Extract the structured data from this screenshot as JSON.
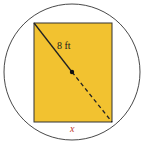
{
  "diagram": {
    "diagonal_label": "8 ft",
    "width_label": "x",
    "colors": {
      "fill": "#f2c230",
      "stroke": "#222222",
      "circle": "#333333",
      "x_label": "#c0392b"
    }
  }
}
